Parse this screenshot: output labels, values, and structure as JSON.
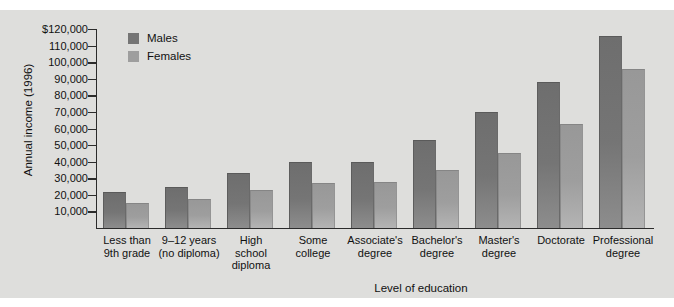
{
  "chart_data": {
    "type": "bar",
    "title": "",
    "xlabel": "Level of education",
    "ylabel": "Annual income (1996)",
    "categories": [
      "Less than\n9th grade",
      "9–12 years\n(no diploma)",
      "High\nschool\ndiploma",
      "Some\ncollege",
      "Associate's\ndegree",
      "Bachelor's\ndegree",
      "Master's\ndegree",
      "Doctorate",
      "Professional\ndegree"
    ],
    "series": [
      {
        "name": "Males",
        "color": "#757575",
        "values": [
          22000,
          25000,
          33000,
          40000,
          40000,
          53000,
          70000,
          88000,
          116000
        ]
      },
      {
        "name": "Females",
        "color": "#9e9e9e",
        "values": [
          15000,
          17500,
          23000,
          27000,
          27500,
          35000,
          45000,
          63000,
          96000
        ]
      }
    ],
    "ylim": [
      0,
      120000
    ],
    "ytick_labels": [
      "$120,000",
      "110,000",
      "100,000",
      "90,000",
      "80,000",
      "70,000",
      "60,000",
      "50,000",
      "40,000",
      "30,000",
      "20,000",
      "10,000"
    ],
    "ytick_values": [
      120000,
      110000,
      100000,
      90000,
      80000,
      70000,
      60000,
      50000,
      40000,
      30000,
      20000,
      10000
    ],
    "grid": false,
    "legend_position": "top-left",
    "background_color": "#dededc"
  },
  "legend": {
    "items": [
      {
        "label": "Males",
        "swatch": "#757575"
      },
      {
        "label": "Females",
        "swatch": "#9e9e9e"
      }
    ]
  },
  "axes": {
    "y_title": "Annual income (1996)",
    "x_title": "Level of education"
  },
  "categories_display": [
    [
      "Less than",
      "9th grade"
    ],
    [
      "9–12 years",
      "(no diploma)"
    ],
    [
      "High",
      "school",
      "diploma"
    ],
    [
      "Some",
      "college"
    ],
    [
      "Associate's",
      "degree"
    ],
    [
      "Bachelor's",
      "degree"
    ],
    [
      "Master's",
      "degree"
    ],
    [
      "Doctorate"
    ],
    [
      "Professional",
      "degree"
    ]
  ]
}
